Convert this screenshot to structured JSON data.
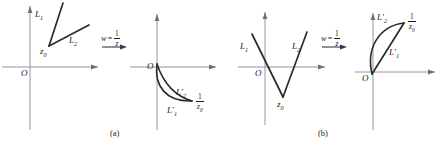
{
  "figure": {
    "caption_a": "(a)",
    "caption_b": "(b)",
    "map_label": {
      "variable": "w",
      "equals": "=",
      "numerator": "1",
      "denominator": "z",
      "icon": "right-arrow-icon"
    },
    "colors": {
      "curve": "#2b2b2b",
      "axis": "#8a8a8a",
      "text": "#1a1a1a",
      "background": "#ffffff"
    }
  },
  "panel_a": {
    "name": "(a)",
    "source": {
      "origin_label": "O",
      "vertex_label": "z",
      "vertex_sub": "0",
      "ray1_label": "L",
      "ray1_sub": "1",
      "ray2_label": "L",
      "ray2_sub": "2",
      "description": "Two rays emanating from the point z0 located in the upper half plane, both pointing up and to the right"
    },
    "image": {
      "origin_label": "O",
      "point_numerator": "1",
      "point_denominator": "z",
      "point_sub": "0",
      "arc1_label": "L",
      "arc1_sub": "1",
      "arc1_prime": "′",
      "arc2_label": "L",
      "arc2_sub": "2",
      "arc2_prime": "′",
      "description": "Two circular arcs from the origin O curving down and right to the point 1/z0, forming a lens"
    }
  },
  "panel_b": {
    "name": "(b)",
    "source": {
      "origin_label": "O",
      "vertex_label": "z",
      "vertex_sub": "0",
      "ray1_label": "L",
      "ray1_sub": "1",
      "ray2_label": "L",
      "ray2_sub": "2",
      "description": "Two rays forming a V with vertex at z0 below the x axis, one going up left and one going up right"
    },
    "image": {
      "origin_label": "O",
      "point_numerator": "1",
      "point_denominator": "z",
      "point_sub": "0",
      "arc1_label": "L",
      "arc1_sub": "1",
      "arc1_prime": "′",
      "arc2_label": "L",
      "arc2_sub": "2",
      "arc2_prime": "′",
      "description": "A circular arc and a straight segment from the origin O to the point 1/z0 in the upper right, forming a lens"
    }
  }
}
